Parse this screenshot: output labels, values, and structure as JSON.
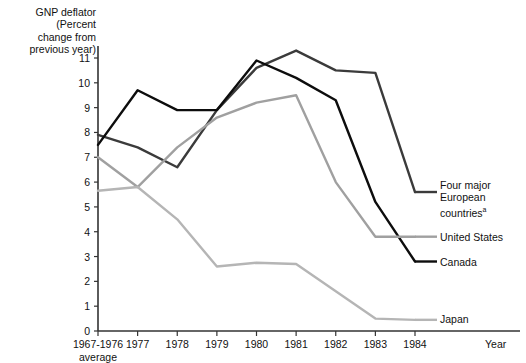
{
  "chart_data": {
    "type": "line",
    "title": "",
    "ylabel": "GNP deflator\n(Percent\nchange from\nprevious year)",
    "xlabel": "Year",
    "grid": false,
    "legend_position": "right-inline",
    "ylim": [
      0,
      11.6
    ],
    "yticks": [
      0,
      1,
      2,
      3,
      4,
      5,
      6,
      7,
      8,
      9,
      10,
      11
    ],
    "ytick_labels": [
      "0",
      "1",
      "2",
      "3",
      "4",
      "5",
      "6",
      "7",
      "8",
      "9",
      "10",
      "11"
    ],
    "categories": [
      "1967-1976",
      "1977",
      "1978",
      "1979",
      "1980",
      "1981",
      "1982",
      "1983",
      "1984"
    ],
    "xtick_labels": [
      "1967-1976",
      "1977",
      "1978",
      "1979",
      "1980",
      "1981",
      "1982",
      "1983",
      "1984"
    ],
    "xtick_sublabel": "average",
    "series": [
      {
        "name": "Four major European countries",
        "label_text": "Four major\nEuropean\ncountries",
        "label_superscript": "a",
        "color": "#3b3b3b",
        "values": [
          7.9,
          7.4,
          6.6,
          8.9,
          10.6,
          11.3,
          10.5,
          10.4,
          5.6
        ]
      },
      {
        "name": "Canada",
        "label_text": "Canada",
        "label_superscript": "",
        "color": "#0d0d0d",
        "values": [
          7.5,
          9.7,
          8.9,
          8.9,
          10.9,
          10.2,
          9.3,
          5.2,
          2.8
        ]
      },
      {
        "name": "United States",
        "label_text": "United States",
        "label_superscript": "",
        "color": "#a0a0a0",
        "values": [
          7.0,
          5.8,
          7.4,
          8.6,
          9.2,
          9.5,
          6.0,
          3.8,
          3.8
        ]
      },
      {
        "name": "Japan",
        "label_text": "Japan",
        "label_superscript": "",
        "color": "#b5b5b5",
        "values": [
          5.65,
          5.8,
          4.5,
          2.6,
          2.75,
          2.7,
          1.6,
          0.5,
          0.45
        ]
      }
    ],
    "footnote_marker": "a"
  }
}
